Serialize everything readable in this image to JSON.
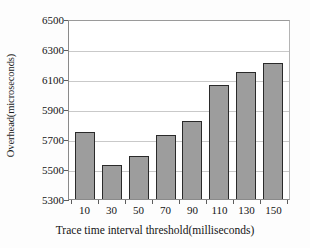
{
  "chart_data": {
    "type": "bar",
    "title": "",
    "xlabel": "Trace time interval threshold(milliseconds)",
    "ylabel": "Overhead(microseconds)",
    "categories": [
      "10",
      "30",
      "50",
      "70",
      "90",
      "110",
      "130",
      "150"
    ],
    "values": [
      5745,
      5530,
      5590,
      5730,
      5820,
      6060,
      6145,
      6210
    ],
    "ylim": [
      5300,
      6500
    ],
    "yticks": [
      5300,
      5500,
      5700,
      5900,
      6100,
      6300,
      6500
    ],
    "ytick_labels": [
      "5300",
      "5500",
      "5700",
      "5900",
      "6100",
      "6300",
      "6500"
    ],
    "grid": true,
    "legend": "none",
    "bar_color": "#9d9d9d",
    "bar_edge_color": "#2a2a2a",
    "gridline_color": "#c9c9c9",
    "axis_color": "#8a8a8a",
    "plot_background": "#ffffff",
    "figure_background": "#fdfdfd"
  }
}
